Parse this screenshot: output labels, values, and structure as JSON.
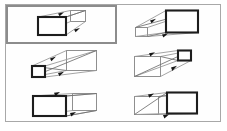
{
  "figure": {
    "panel": {
      "border_color": "#a8a8a8",
      "background": "#fefefe"
    },
    "selection": {
      "present": true,
      "target_cell": "cell-1",
      "border_color": "#8c8c8c",
      "label": "selected-cell-highlight"
    },
    "grid": {
      "rows": 3,
      "columns": 2,
      "cell_count": 6
    },
    "colors": {
      "bold_face_stroke": "#1d1d1d",
      "light_face_stroke": "#8f8f8f",
      "connector_stroke": "#9a9a9a",
      "diagonal_stroke": "#6e6e6e",
      "arrowhead_fill": "#161616",
      "panel_border": "#a8a8a8",
      "selection_border": "#8c8c8c",
      "page_background": "#ffffff"
    },
    "cells": [
      {
        "id": "cell-1",
        "name": "box-top-left",
        "row": 1,
        "column": 1,
        "bold_face": "left",
        "bold_face_size": "large",
        "light_face": "right",
        "light_face_size": "medium",
        "direction": "recedes-right-upward",
        "arrow_count": 2,
        "selected": true
      },
      {
        "id": "cell-2",
        "name": "box-top-right",
        "row": 1,
        "column": 2,
        "bold_face": "right",
        "bold_face_size": "large",
        "light_face": "left",
        "light_face_size": "small",
        "direction": "recedes-left-downward",
        "arrow_count": 2,
        "selected": false
      },
      {
        "id": "cell-3",
        "name": "box-middle-left",
        "row": 2,
        "column": 1,
        "bold_face": "left",
        "bold_face_size": "small",
        "light_face": "right",
        "light_face_size": "large",
        "direction": "recedes-right-upward",
        "arrow_count": 2,
        "selected": false
      },
      {
        "id": "cell-4",
        "name": "box-middle-right",
        "row": 2,
        "column": 2,
        "bold_face": "right",
        "bold_face_size": "small",
        "light_face": "left",
        "light_face_size": "large",
        "direction": "recedes-right-upward",
        "arrow_count": 2,
        "selected": false
      },
      {
        "id": "cell-5",
        "name": "box-bottom-left",
        "row": 3,
        "column": 1,
        "bold_face": "left",
        "bold_face_size": "large",
        "light_face": "right",
        "light_face_size": "medium",
        "direction": "recedes-right-level",
        "arrow_count": 2,
        "selected": false
      },
      {
        "id": "cell-6",
        "name": "box-bottom-right",
        "row": 3,
        "column": 2,
        "bold_face": "right",
        "bold_face_size": "large",
        "light_face": "left",
        "light_face_size": "medium",
        "direction": "recedes-left-level",
        "arrow_count": 2,
        "selected": false
      }
    ]
  }
}
